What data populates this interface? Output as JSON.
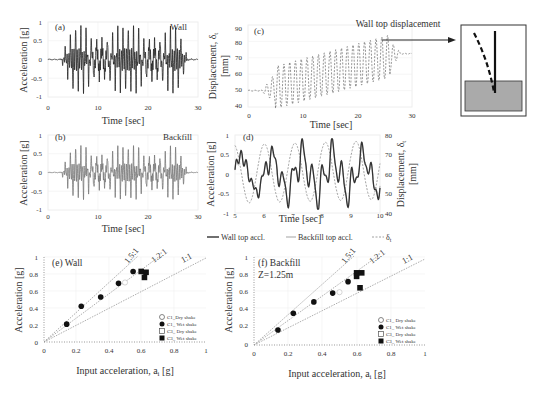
{
  "figure": {
    "panels": {
      "a": {
        "label": "(a)",
        "title": "Wall",
        "xlabel": "Time [sec]",
        "ylabel": "Acceleration [g]",
        "xticks": [
          "0",
          "10",
          "20",
          "30"
        ],
        "yticks": [
          "1",
          "0.5",
          "0",
          "-0.5",
          "-1"
        ]
      },
      "b": {
        "label": "(b)",
        "title": "Backfill",
        "xlabel": "Time [sec]",
        "ylabel": "Acceleration [g]",
        "xticks": [
          "0",
          "10",
          "20",
          "30"
        ],
        "yticks": [
          "1",
          "0.5",
          "0",
          "-0.5",
          "-1"
        ]
      },
      "c": {
        "label": "(c)",
        "annotation": "Wall top displacement",
        "xlabel": "Time [sec]",
        "ylabel_line1": "Displacement, δ",
        "ylabel_sub": "t",
        "ylabel_line2": "[mm]",
        "xticks": [
          "0",
          "10",
          "20",
          "30"
        ],
        "yticks": [
          "90",
          "80",
          "70",
          "60",
          "50",
          "40"
        ]
      },
      "d": {
        "label": "(d)",
        "xlabel": "Time [sec]",
        "ylabel": "Acceleration [g]",
        "ylabel_right_line1": "Displacement, δ",
        "ylabel_right_sub": "t",
        "ylabel_right_line2": "[mm]",
        "xticks": [
          "5",
          "6",
          "7",
          "8",
          "9",
          "10"
        ],
        "yticks": [
          "1",
          "0.5",
          "0",
          "-0.5",
          "-1"
        ],
        "yticks_right": [
          "80",
          "70",
          "60",
          "50",
          "40"
        ],
        "legend": [
          "Wall top accl.",
          "Backfill top accl.",
          "δt"
        ]
      },
      "e": {
        "label": "(e) Wall",
        "xlabel_main": "Input acceleration, a",
        "xlabel_sub": "i",
        "xlabel_unit": " [g]",
        "ylabel": "Acceleration [g]",
        "xticks": [
          "0",
          "0.2",
          "0.4",
          "0.6",
          "0.8",
          "1"
        ],
        "yticks": [
          "1",
          "0.8",
          "0.6",
          "0.4",
          "0.2",
          "0"
        ],
        "ratio_labels": [
          "1.5:1",
          "1.2:1",
          "1:1"
        ],
        "legend": [
          "C1_Dry shake",
          "C1_ Wet shake",
          "C3_ Dry shake",
          "C3_ Wet shake"
        ]
      },
      "f": {
        "label": "(f) Backfill",
        "sublabel": "Z=1.25m",
        "xlabel_main": "Input acceleration, a",
        "xlabel_sub": "i",
        "xlabel_unit": " [g]",
        "ylabel": "Acceleration [g]",
        "xticks": [
          "0",
          "0.2",
          "0.4",
          "0.6",
          "0.8",
          "1"
        ],
        "yticks": [
          "1",
          "0.8",
          "0.6",
          "0.4",
          "0.2",
          "0"
        ],
        "ratio_labels": [
          "1.5:1",
          "1.2:1",
          "1:1"
        ],
        "legend": [
          "C1_ Dry shake",
          "C1_ Wet shake",
          "C3_ Dry shake",
          "C3_ Wet shake"
        ]
      }
    }
  },
  "chart_data": [
    {
      "type": "line",
      "title": "(a) Wall",
      "xlabel": "Time [sec]",
      "ylabel": "Acceleration [g]",
      "xlim": [
        0,
        30
      ],
      "ylim": [
        -1,
        1
      ],
      "grid": true,
      "series": [
        {
          "name": "Wall acceleration",
          "description": "sinusoidal shaking, ~1.4 Hz cycles, amplitude ramps to ~0.75g from 3-27s, peaks ~+0.75/-0.7"
        }
      ]
    },
    {
      "type": "line",
      "title": "(b) Backfill",
      "xlabel": "Time [sec]",
      "ylabel": "Acceleration [g]",
      "xlim": [
        0,
        30
      ],
      "ylim": [
        -1,
        1
      ],
      "grid": true,
      "series": [
        {
          "name": "Backfill acceleration",
          "description": "sinusoidal shaking, amplitude ~0.6g from 3-27s"
        }
      ]
    },
    {
      "type": "line",
      "title": "(c) Wall top displacement",
      "xlabel": "Time [sec]",
      "ylabel": "Displacement, δt [mm]",
      "xlim": [
        0,
        30
      ],
      "ylim": [
        40,
        90
      ],
      "grid": true,
      "series": [
        {
          "name": "δt",
          "x": [
            0,
            3,
            5,
            8,
            10,
            15,
            20,
            25,
            27,
            30
          ],
          "y": [
            50,
            50,
            55,
            60,
            62,
            65,
            68,
            72,
            73,
            73
          ],
          "description": "dashed oscillating displacement, mean drifts from 50 to ~73 mm, oscillation envelope 43-83 mm"
        }
      ]
    },
    {
      "type": "line",
      "title": "(d)",
      "xlabel": "Time [sec]",
      "ylabel": "Acceleration [g]",
      "ylabel_right": "Displacement, δt [mm]",
      "xlim": [
        5,
        10
      ],
      "ylim": [
        -1,
        1
      ],
      "ylim_right": [
        40,
        80
      ],
      "grid": true,
      "legend": [
        "Wall top accl.",
        "Backfill top accl.",
        "δt"
      ],
      "series": [
        {
          "name": "Wall top accl.",
          "peaks": [
            0.75,
            0.75,
            0.75,
            0.75,
            0.75
          ],
          "troughs": [
            -0.65,
            -0.65,
            -0.65,
            -0.7,
            -0.65
          ]
        },
        {
          "name": "Backfill top accl.",
          "description": "closely follows wall top accl."
        },
        {
          "name": "δt",
          "peaks_mm": [
            68,
            70,
            76,
            77,
            78
          ],
          "troughs_mm": [
            47,
            46,
            46,
            46,
            46
          ]
        }
      ]
    },
    {
      "type": "scatter",
      "title": "(e) Wall",
      "xlabel": "Input acceleration, ai [g]",
      "ylabel": "Acceleration [g]",
      "xlim": [
        0,
        1
      ],
      "ylim": [
        0,
        1
      ],
      "grid": true,
      "legend_position": "lower right",
      "series": [
        {
          "name": "C1_ Wet shake",
          "marker": "filled circle",
          "x": [
            0.14,
            0.23,
            0.35,
            0.46,
            0.55
          ],
          "y": [
            0.21,
            0.42,
            0.53,
            0.69,
            0.83
          ]
        },
        {
          "name": "C1_Dry shake",
          "marker": "open circle",
          "x": [
            0.5
          ],
          "y": [
            0.7
          ]
        },
        {
          "name": "C3_ Wet shake",
          "marker": "filled square",
          "x": [
            0.6,
            0.62,
            0.63
          ],
          "y": [
            0.83,
            0.76,
            0.82
          ]
        }
      ],
      "reference_lines": [
        {
          "label": "1.5:1",
          "slope": 1.5
        },
        {
          "label": "1.2:1",
          "slope": 1.2
        },
        {
          "label": "1:1",
          "slope": 1.0
        }
      ]
    },
    {
      "type": "scatter",
      "title": "(f) Backfill Z=1.25m",
      "xlabel": "Input acceleration, ai [g]",
      "ylabel": "Acceleration [g]",
      "xlim": [
        0,
        1
      ],
      "ylim": [
        0,
        1
      ],
      "grid": true,
      "legend_position": "lower right",
      "series": [
        {
          "name": "C1_ Wet shake",
          "marker": "filled circle",
          "x": [
            0.14,
            0.23,
            0.35,
            0.46,
            0.55
          ],
          "y": [
            0.17,
            0.36,
            0.49,
            0.59,
            0.72
          ]
        },
        {
          "name": "C1_ Dry shake",
          "marker": "open circle",
          "x": [
            0.5
          ],
          "y": [
            0.6
          ]
        },
        {
          "name": "C3_ Wet shake",
          "marker": "filled square",
          "x": [
            0.6,
            0.6,
            0.63,
            0.62
          ],
          "y": [
            0.82,
            0.78,
            0.82,
            0.65
          ]
        }
      ],
      "reference_lines": [
        {
          "label": "1.5:1",
          "slope": 1.5
        },
        {
          "label": "1.2:1",
          "slope": 1.2
        },
        {
          "label": "1:1",
          "slope": 1.0
        }
      ]
    }
  ]
}
